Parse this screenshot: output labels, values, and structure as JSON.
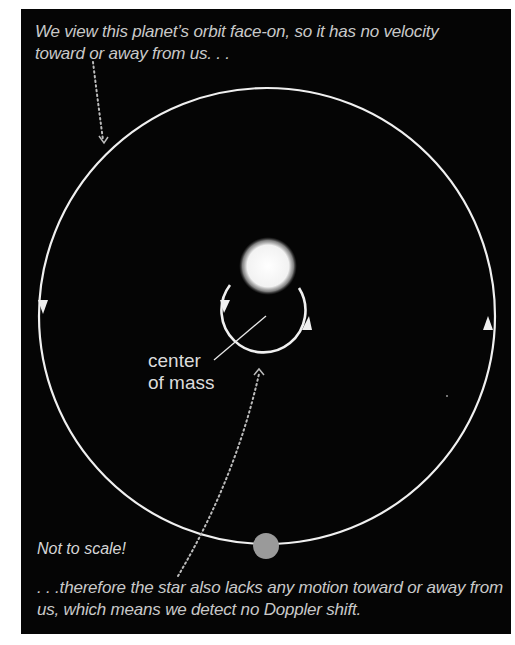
{
  "captions": {
    "top": "We view this planet’s orbit face-on, so it has no velocity toward or away from us. . .",
    "bottom": ". . .therefore the star also lacks any motion toward or away from us, which means we detect no Doppler shift.",
    "not_to_scale": "Not to scale!"
  },
  "labels": {
    "center_of_mass": "center of mass",
    "center_of_mass_line1": "center",
    "center_of_mass_line2": "of mass"
  },
  "objects": {
    "star": "star",
    "planet": "planet",
    "planet_orbit": "planet orbit (face-on, counterclockwise arrows)",
    "star_orbit": "star orbit around center of mass"
  },
  "colors": {
    "background": "#050505",
    "orbit_line": "#f2f2f2",
    "star": "#f4f4f4",
    "planet": "#9a9a9a",
    "caption_text": "#c9c9c9"
  }
}
